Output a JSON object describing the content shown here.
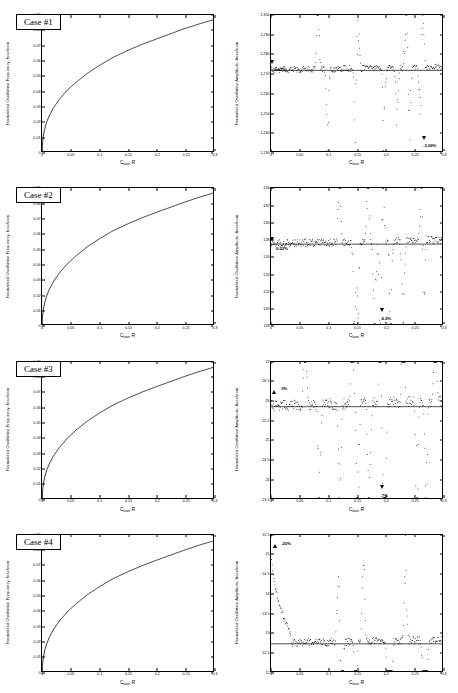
{
  "figure": {
    "rows": 4,
    "cols": 2,
    "background": "#ffffff",
    "line_color": "#000000"
  },
  "axis_labels": {
    "x_main": "C",
    "x_sub": "laser",
    "x_tail": "·R",
    "y_left": "Normalized Oscillation Frequency, fosc/nom",
    "y_right": "Normalized Oscillation Amplitude, Aosc/nom"
  },
  "x_axis": {
    "min": 0,
    "max": 0.3,
    "ticks": [
      0,
      0.05,
      0.1,
      0.15,
      0.2,
      0.25,
      0.3
    ],
    "tick_labels": [
      "0",
      "0.05",
      "0.1",
      "0.15",
      "0.2",
      "0.25",
      "0.3"
    ]
  },
  "chart_data": [
    {
      "id": "case1-frequency",
      "type": "line",
      "title": "Case #1",
      "case_label": "Case #1",
      "xlabel": "C_laser·R",
      "ylabel": "Normalized Oscillation Frequency, fosc/nom",
      "xlim": [
        0,
        0.3
      ],
      "ylim": [
        0,
        0.09
      ],
      "yticks": [
        0,
        0.01,
        0.02,
        0.03,
        0.04,
        0.05,
        0.06,
        0.07,
        0.08,
        0.09
      ],
      "ytick_labels": [
        "0",
        "0.01",
        "0.02",
        "0.03",
        "0.04",
        "0.05",
        "0.06",
        "0.07",
        "0.08",
        "0.09"
      ],
      "grid": false,
      "legend": null,
      "series": [
        {
          "name": "normalized frequency",
          "x": [
            0.0,
            0.0015,
            0.004,
            0.008,
            0.013,
            0.02,
            0.03,
            0.045,
            0.06,
            0.08,
            0.1,
            0.125,
            0.15,
            0.175,
            0.2,
            0.225,
            0.25,
            0.275,
            0.3
          ],
          "y": [
            0.0,
            0.008,
            0.0135,
            0.019,
            0.0235,
            0.0285,
            0.034,
            0.0405,
            0.0455,
            0.0515,
            0.0565,
            0.062,
            0.0665,
            0.0705,
            0.074,
            0.0775,
            0.081,
            0.084,
            0.0868
          ]
        }
      ]
    },
    {
      "id": "case1-amplitude",
      "type": "scatter",
      "title": "Case #1",
      "xlabel": "C_laser·R",
      "ylabel": "Normalized Oscillation Amplitude, Aosc/nom",
      "xlim": [
        0,
        0.3
      ],
      "ylim": [
        1.23,
        1.3
      ],
      "yticks": [
        1.23,
        1.24,
        1.25,
        1.26,
        1.27,
        1.28,
        1.29,
        1.3
      ],
      "ytick_labels": [
        "1.230",
        "1.240",
        "1.250",
        "1.260",
        "1.270",
        "1.280",
        "1.290",
        "1.300"
      ],
      "baseline": 1.2715,
      "grid": false,
      "annotations": [
        {
          "text": "0.03%",
          "x": 0.004,
          "y": 1.2725,
          "marker": "down",
          "marker_x": 0.002,
          "marker_y": 1.276
        },
        {
          "text": "-3.00%",
          "x": 0.262,
          "y": 1.234,
          "marker": "down",
          "marker_x": 0.2655,
          "marker_y": 1.2375
        }
      ],
      "spike_positions": [
        0.082,
        0.099,
        0.148,
        0.152,
        0.198,
        0.221,
        0.237,
        0.243,
        0.262,
        0.266
      ],
      "noise_amplitude": 0.0016
    },
    {
      "id": "case2-frequency",
      "type": "line",
      "title": "Case #2",
      "case_label": "Case #2",
      "xlabel": "C_laser·R",
      "ylabel": "Normalized Oscillation Frequency, fosc/nom",
      "xlim": [
        0,
        0.3
      ],
      "ylim": [
        0,
        0.09
      ],
      "yticks": [
        0,
        0.01,
        0.02,
        0.03,
        0.04,
        0.05,
        0.06,
        0.07,
        0.08,
        0.09
      ],
      "ytick_labels": [
        "0",
        "0.01",
        "0.02",
        "0.03",
        "0.04",
        "0.05",
        "0.06",
        "0.07",
        "0.08",
        "0.09"
      ],
      "grid": false,
      "series": [
        {
          "name": "normalized frequency",
          "x": [
            0.0,
            0.0015,
            0.004,
            0.008,
            0.013,
            0.02,
            0.03,
            0.045,
            0.06,
            0.08,
            0.1,
            0.125,
            0.15,
            0.175,
            0.2,
            0.225,
            0.25,
            0.275,
            0.3
          ],
          "y": [
            0.0,
            0.0075,
            0.013,
            0.0185,
            0.023,
            0.028,
            0.0335,
            0.04,
            0.0452,
            0.0512,
            0.0562,
            0.0618,
            0.0662,
            0.0702,
            0.0738,
            0.0772,
            0.0806,
            0.0838,
            0.0866
          ]
        }
      ]
    },
    {
      "id": "case2-amplitude",
      "type": "scatter",
      "title": "Case #2",
      "xlabel": "C_laser·R",
      "ylabel": "Normalized Oscillation Amplitude, Aosc/nom",
      "xlim": [
        0,
        0.3
      ],
      "ylim": [
        118,
        134
      ],
      "yticks": [
        118,
        120,
        122,
        124,
        126,
        128,
        130,
        132,
        134
      ],
      "ytick_labels": [
        "118",
        "120",
        "122",
        "124",
        "126",
        "128",
        "130",
        "132",
        "134"
      ],
      "baseline": 127.4,
      "grid": false,
      "annotations": [
        {
          "text": "0.02%",
          "x": 0.007,
          "y": 127.1,
          "marker": "down",
          "marker_x": 0.003,
          "marker_y": 128.1
        },
        {
          "text": "-6.5%",
          "x": 0.188,
          "y": 118.9,
          "marker": "down",
          "marker_x": 0.193,
          "marker_y": 119.9
        }
      ],
      "spike_positions": [
        0.12,
        0.146,
        0.152,
        0.17,
        0.182,
        0.192,
        0.196,
        0.21,
        0.232,
        0.264,
        0.268
      ],
      "noise_amplitude": 0.45
    },
    {
      "id": "case3-frequency",
      "type": "line",
      "title": "Case #3",
      "case_label": "Case #3",
      "xlabel": "C_laser·R",
      "ylabel": "Normalized Oscillation Frequency, fosc/nom",
      "xlim": [
        0,
        0.3
      ],
      "ylim": [
        0,
        0.09
      ],
      "yticks": [
        0,
        0.01,
        0.02,
        0.03,
        0.04,
        0.05,
        0.06,
        0.07,
        0.08,
        0.09
      ],
      "ytick_labels": [
        "0",
        "0.01",
        "0.02",
        "0.03",
        "0.04",
        "0.05",
        "0.06",
        "0.07",
        "0.08",
        "0.09"
      ],
      "grid": false,
      "series": [
        {
          "name": "normalized frequency",
          "x": [
            0.0,
            0.0015,
            0.004,
            0.008,
            0.013,
            0.02,
            0.03,
            0.045,
            0.06,
            0.08,
            0.1,
            0.125,
            0.15,
            0.175,
            0.2,
            0.225,
            0.25,
            0.275,
            0.3
          ],
          "y": [
            0.0,
            0.0072,
            0.0128,
            0.0182,
            0.0228,
            0.0278,
            0.0332,
            0.0398,
            0.045,
            0.051,
            0.056,
            0.0616,
            0.066,
            0.07,
            0.0736,
            0.077,
            0.0804,
            0.0836,
            0.0864
          ]
        }
      ]
    },
    {
      "id": "case3-amplitude",
      "type": "scatter",
      "title": "Case #3",
      "xlabel": "C_laser·R",
      "ylabel": "Normalized Oscillation Amplitude, Aosc/nom",
      "xlim": [
        0,
        0.3
      ],
      "ylim": [
        23.5,
        27
      ],
      "yticks": [
        23.5,
        24,
        24.5,
        25,
        25.5,
        26,
        26.5,
        27
      ],
      "ytick_labels": [
        "23.5",
        "24",
        "24.5",
        "25",
        "25.5",
        "26",
        "26.5",
        "27"
      ],
      "baseline": 25.85,
      "grid": false,
      "annotations": [
        {
          "text": "3%",
          "x": 0.016,
          "y": 26.32,
          "marker": "up",
          "marker_x": 0.006,
          "marker_y": 26.22
        },
        {
          "text": "-7%",
          "x": 0.188,
          "y": 23.62,
          "marker": "down",
          "marker_x": 0.194,
          "marker_y": 23.82
        }
      ],
      "spike_positions": [
        0.06,
        0.085,
        0.12,
        0.143,
        0.152,
        0.172,
        0.192,
        0.196,
        0.2,
        0.232,
        0.256,
        0.272,
        0.288
      ],
      "noise_amplitude": 0.14
    },
    {
      "id": "case4-frequency",
      "type": "line",
      "title": "Case #4",
      "case_label": "Case #4",
      "xlabel": "C_laser·R",
      "ylabel": "Normalized Oscillation Frequency, fosc/nom",
      "xlim": [
        0,
        0.3
      ],
      "ylim": [
        0,
        0.09
      ],
      "yticks": [
        0,
        0.01,
        0.02,
        0.03,
        0.04,
        0.05,
        0.06,
        0.07,
        0.08,
        0.09
      ],
      "ytick_labels": [
        "0",
        "0.01",
        "0.02",
        "0.03",
        "0.04",
        "0.05",
        "0.06",
        "0.07",
        "0.08",
        "0.09"
      ],
      "grid": false,
      "series": [
        {
          "name": "normalized frequency",
          "x": [
            0.0,
            0.0015,
            0.004,
            0.008,
            0.013,
            0.02,
            0.03,
            0.045,
            0.06,
            0.08,
            0.1,
            0.125,
            0.15,
            0.175,
            0.2,
            0.225,
            0.25,
            0.275,
            0.3
          ],
          "y": [
            0.0,
            0.0068,
            0.0124,
            0.0178,
            0.0224,
            0.0274,
            0.0328,
            0.0394,
            0.0446,
            0.0506,
            0.0556,
            0.0612,
            0.0656,
            0.0696,
            0.0732,
            0.0766,
            0.08,
            0.0832,
            0.086
          ]
        }
      ]
    },
    {
      "id": "case4-amplitude",
      "type": "scatter",
      "title": "Case #4",
      "xlabel": "C_laser·R",
      "ylabel": "Normalized Oscillation Amplitude, Aosc/nom",
      "xlim": [
        12,
        15.5
      ],
      "ylim": [
        12,
        15.5
      ],
      "yticks": [
        12,
        12.5,
        13,
        13.5,
        14,
        14.5,
        15,
        15.5
      ],
      "ytick_labels": [
        "12",
        "12.5",
        "13",
        "13.5",
        "14",
        "14.5",
        "15",
        "15.5"
      ],
      "baseline": 12.7,
      "grid": false,
      "annotations": [
        {
          "text": "-20%",
          "x": 0.016,
          "y": 15.3,
          "marker": "up",
          "marker_x": 0.008,
          "marker_y": 15.22
        }
      ],
      "spike_positions": [
        0.118,
        0.124,
        0.148,
        0.162,
        0.205,
        0.21,
        0.236,
        0.268,
        0.272
      ],
      "noise_amplitude": 0.1,
      "decay": {
        "x_start": 0.0,
        "y_start": 15.45,
        "x_end": 0.035,
        "y_end": 12.95
      }
    }
  ]
}
